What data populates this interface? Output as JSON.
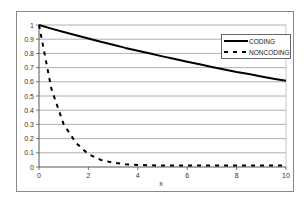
{
  "chart_data": {
    "type": "line",
    "title": "",
    "xlabel": "x",
    "ylabel": "",
    "xlim": [
      0,
      10
    ],
    "ylim": [
      0,
      1
    ],
    "x_ticks": [
      0,
      2,
      4,
      6,
      8,
      10
    ],
    "y_ticks": [
      0,
      0.1,
      0.2,
      0.3,
      0.4,
      0.5,
      0.6,
      0.7,
      0.8,
      0.9,
      1
    ],
    "y_tick_labels": [
      "0",
      "0.1",
      "0.2",
      "0.3",
      "0.4",
      "0.5",
      "0.6",
      "0.7",
      "0.8",
      "0.9",
      "1"
    ],
    "grid": {
      "horizontal": true,
      "vertical": false
    },
    "legend_position": "upper-right-inside",
    "x": [
      0,
      0.5,
      1,
      1.5,
      2,
      2.5,
      3,
      3.5,
      4,
      4.5,
      5,
      5.5,
      6,
      6.5,
      7,
      7.5,
      8,
      8.5,
      9,
      9.5,
      10
    ],
    "series": [
      {
        "name": "CODING",
        "style": "solid",
        "color": "#000000",
        "values": [
          1.0,
          0.975,
          0.951,
          0.928,
          0.905,
          0.882,
          0.861,
          0.839,
          0.819,
          0.799,
          0.779,
          0.76,
          0.741,
          0.723,
          0.705,
          0.687,
          0.67,
          0.654,
          0.638,
          0.622,
          0.607
        ]
      },
      {
        "name": "NONCODING",
        "style": "dashed",
        "color": "#000000",
        "values": [
          1.0,
          0.55,
          0.3,
          0.17,
          0.09,
          0.05,
          0.03,
          0.02,
          0.015,
          0.012,
          0.01,
          0.01,
          0.01,
          0.01,
          0.01,
          0.01,
          0.01,
          0.01,
          0.01,
          0.01,
          0.01
        ]
      }
    ]
  }
}
